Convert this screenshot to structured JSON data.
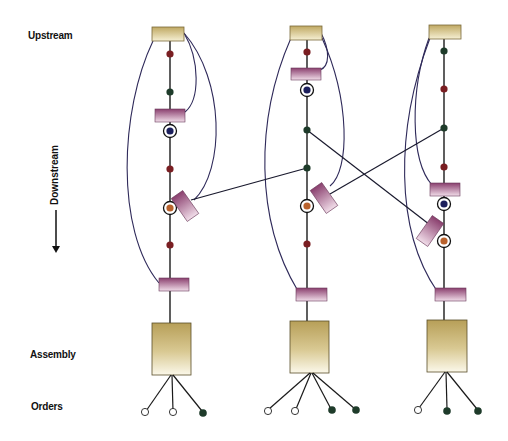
{
  "labels": {
    "upstream": "Upstream",
    "downstream": "Downstream",
    "assembly": "Assembly",
    "orders": "Orders"
  },
  "colors": {
    "stock_box_top": "#c9b87a",
    "stock_box_bottom": "#f3ecc8",
    "buffer_bar_top": "#8a3f6e",
    "buffer_bar_bottom": "#f1dde9",
    "dot_red": "#7a1e22",
    "dot_green": "#1e3b2a",
    "dot_blue": "#1c1f5c",
    "dot_orange": "#b9622d",
    "line": "#1a1a1a",
    "curve": "#2f2a5a"
  },
  "columns": [
    {
      "name": "column-1",
      "x": 170,
      "nodes": [
        "source-box",
        "dot-red",
        "dot-green",
        "buffer-bar",
        "circled-blue",
        "dot-red",
        "tilted-buffer",
        "circled-orange",
        "dot-red",
        "buffer-bar",
        "assembly-box"
      ],
      "orders": [
        "open",
        "open",
        "filled"
      ]
    },
    {
      "name": "column-2",
      "x": 307,
      "nodes": [
        "source-box",
        "dot-red",
        "buffer-bar",
        "circled-blue",
        "dot-green",
        "dot-green",
        "tilted-buffer",
        "circled-orange",
        "dot-red",
        "buffer-bar",
        "assembly-box"
      ],
      "orders": [
        "open",
        "open",
        "filled",
        "filled"
      ]
    },
    {
      "name": "column-3",
      "x": 444,
      "nodes": [
        "source-box",
        "dot-green",
        "dot-red",
        "dot-green",
        "dot-red",
        "buffer-bar",
        "circled-blue",
        "tilted-buffer",
        "circled-orange",
        "buffer-bar",
        "assembly-box"
      ],
      "orders": [
        "open",
        "filled",
        "filled"
      ]
    }
  ]
}
